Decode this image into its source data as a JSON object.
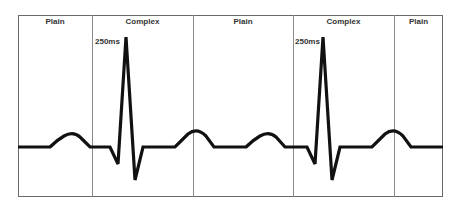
{
  "segments": [
    {
      "label": "Plain",
      "x0": 18,
      "x1": 92
    },
    {
      "label": "Complex",
      "x0": 92,
      "x1": 193
    },
    {
      "label": "Plain",
      "x0": 193,
      "x1": 293
    },
    {
      "label": "Complex",
      "x0": 293,
      "x1": 394
    },
    {
      "label": "Plain",
      "x0": 394,
      "x1": 443
    }
  ],
  "annotations": [
    {
      "text": "250ms"
    },
    {
      "text": "250ms"
    }
  ],
  "waveform": {
    "color": "#111111",
    "stroke_width": 3.2
  }
}
